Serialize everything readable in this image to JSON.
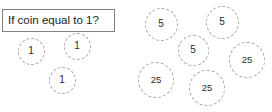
{
  "diagram": {
    "background_color": "#ffffff",
    "decision_box": {
      "text": "If coin equal to 1?",
      "border_color": "#808080",
      "x": 2,
      "y": 9,
      "width": 113,
      "height": 23
    },
    "coin_style": {
      "border_color": "#a6a6a6",
      "border_style": "dashed",
      "text_color": "#2b2b2b"
    },
    "groups": [
      {
        "name": "ones-group",
        "coins": [
          {
            "label": "1",
            "cx": 31,
            "cy": 51,
            "d": 27
          },
          {
            "label": "1",
            "cx": 77,
            "cy": 46,
            "d": 27
          },
          {
            "label": "1",
            "cx": 62,
            "cy": 80,
            "d": 27
          }
        ]
      },
      {
        "name": "fives-group",
        "coins": [
          {
            "label": "5",
            "cx": 161,
            "cy": 24,
            "d": 33
          },
          {
            "label": "5",
            "cx": 222,
            "cy": 22,
            "d": 33
          },
          {
            "label": "5",
            "cx": 193,
            "cy": 50,
            "d": 31
          }
        ]
      },
      {
        "name": "twentyfives-group",
        "coins": [
          {
            "label": "25",
            "cx": 247,
            "cy": 60,
            "d": 36
          },
          {
            "label": "25",
            "cx": 156,
            "cy": 80,
            "d": 36
          },
          {
            "label": "25",
            "cx": 207,
            "cy": 88,
            "d": 36
          }
        ]
      }
    ]
  }
}
